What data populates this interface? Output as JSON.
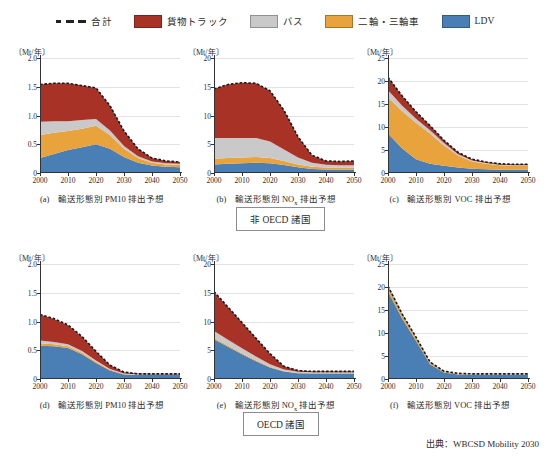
{
  "legend": {
    "items": [
      {
        "name": "total",
        "label": "合計",
        "style": "dashed-line",
        "color": "#222222"
      },
      {
        "name": "freight-truck",
        "label": "貨物トラック",
        "style": "swatch",
        "color": "#a93226"
      },
      {
        "name": "bus",
        "label": "バス",
        "style": "swatch",
        "color": "#c9c9c9"
      },
      {
        "name": "two-three-wheeler",
        "label": "二輪・三輪車",
        "style": "swatch",
        "color": "#e8a council"
      },
      {
        "name": "ldv",
        "label": "LDV",
        "style": "swatch",
        "color": "#4a7fb5"
      }
    ]
  },
  "groups": [
    {
      "name": "non-oecd",
      "label": "非 OECD 諸国"
    },
    {
      "name": "oecd",
      "label": "OECD 諸国"
    }
  ],
  "source": "出典：WBCSD Mobility 2030",
  "axis_unit": "〔Mt/年〕",
  "chart_data": [
    {
      "id": "a",
      "type": "area",
      "stacked": true,
      "caption_prefix": "(a)",
      "caption": "輸送形態別 PM10 排出予想",
      "caption_sub": "",
      "region": "非 OECD 諸国",
      "title": "輸送形態別 PM10 排出予想",
      "xlabel": "",
      "ylabel": "〔Mt/年〕",
      "ylim": [
        0,
        2.0
      ],
      "yticks": [
        0,
        0.5,
        1.0,
        1.5,
        2.0
      ],
      "ytick_labels": [
        "0",
        "0.5",
        "1.0",
        "1.5",
        "2.0"
      ],
      "xlim": [
        2000,
        2050
      ],
      "xticks": [
        2000,
        2010,
        2020,
        2030,
        2040,
        2050
      ],
      "xtick_labels": [
        "2000",
        "2010",
        "2020",
        "2030",
        "2040",
        "2050"
      ],
      "x": [
        2000,
        2005,
        2010,
        2015,
        2020,
        2025,
        2030,
        2035,
        2040,
        2045,
        2050
      ],
      "series": [
        {
          "name": "LDV",
          "color": "#4a7fb5",
          "values": [
            0.26,
            0.33,
            0.4,
            0.45,
            0.5,
            0.42,
            0.28,
            0.18,
            0.13,
            0.11,
            0.1
          ]
        },
        {
          "name": "二輪・三輪車",
          "color": "#e8a33d",
          "values": [
            0.4,
            0.37,
            0.33,
            0.32,
            0.32,
            0.24,
            0.14,
            0.08,
            0.05,
            0.04,
            0.04
          ]
        },
        {
          "name": "バス",
          "color": "#c9c9c9",
          "values": [
            0.23,
            0.2,
            0.17,
            0.15,
            0.12,
            0.08,
            0.05,
            0.03,
            0.02,
            0.02,
            0.02
          ]
        },
        {
          "name": "貨物トラック",
          "color": "#a93226",
          "values": [
            0.65,
            0.66,
            0.66,
            0.6,
            0.54,
            0.43,
            0.26,
            0.13,
            0.06,
            0.04,
            0.03
          ]
        }
      ],
      "total": [
        1.54,
        1.56,
        1.56,
        1.52,
        1.48,
        1.17,
        0.73,
        0.42,
        0.26,
        0.21,
        0.19
      ]
    },
    {
      "id": "b",
      "type": "area",
      "stacked": true,
      "caption_prefix": "(b)",
      "caption": "輸送形態別 NOx 排出予想",
      "caption_sub": "x",
      "region": "非 OECD 諸国",
      "title": "輸送形態別 NOx 排出予想",
      "xlabel": "",
      "ylabel": "〔Mt/年〕",
      "ylim": [
        0,
        20
      ],
      "yticks": [
        0,
        5,
        10,
        15,
        20
      ],
      "ytick_labels": [
        "0",
        "5",
        "10",
        "15",
        "20"
      ],
      "xlim": [
        2000,
        2050
      ],
      "xticks": [
        2000,
        2010,
        2020,
        2030,
        2040,
        2050
      ],
      "xtick_labels": [
        "2000",
        "2010",
        "2020",
        "2030",
        "2040",
        "2050"
      ],
      "x": [
        2000,
        2005,
        2010,
        2015,
        2020,
        2025,
        2030,
        2035,
        2040,
        2045,
        2050
      ],
      "series": [
        {
          "name": "LDV",
          "color": "#4a7fb5",
          "values": [
            1.5,
            1.6,
            1.7,
            1.8,
            1.7,
            1.4,
            1.0,
            0.7,
            0.6,
            0.55,
            0.55
          ]
        },
        {
          "name": "二輪・三輪車",
          "color": "#e8a33d",
          "values": [
            1.0,
            1.0,
            1.0,
            1.0,
            0.9,
            0.7,
            0.5,
            0.4,
            0.35,
            0.35,
            0.35
          ]
        },
        {
          "name": "バス",
          "color": "#c9c9c9",
          "values": [
            3.6,
            3.5,
            3.4,
            3.3,
            2.9,
            2.0,
            1.2,
            0.7,
            0.5,
            0.45,
            0.45
          ]
        },
        {
          "name": "貨物トラック",
          "color": "#a93226",
          "values": [
            8.5,
            9.3,
            9.6,
            9.5,
            8.8,
            6.8,
            3.6,
            1.3,
            0.65,
            0.65,
            0.75
          ]
        }
      ],
      "total": [
        14.6,
        15.4,
        15.7,
        15.6,
        14.3,
        10.9,
        6.3,
        3.1,
        2.1,
        2.0,
        2.1
      ]
    },
    {
      "id": "c",
      "type": "area",
      "stacked": true,
      "caption_prefix": "(c)",
      "caption": "輸送形態別 VOC 排出予想",
      "caption_sub": "",
      "region": "非 OECD 諸国",
      "title": "輸送形態別 VOC 排出予想",
      "xlabel": "",
      "ylabel": "〔Mt/年〕",
      "ylim": [
        0,
        25
      ],
      "yticks": [
        0,
        5,
        10,
        15,
        20,
        25
      ],
      "ytick_labels": [
        "0",
        "5",
        "10",
        "15",
        "20",
        "25"
      ],
      "xlim": [
        2000,
        2050
      ],
      "xticks": [
        2000,
        2010,
        2020,
        2030,
        2040,
        2050
      ],
      "xtick_labels": [
        "2000",
        "2010",
        "2020",
        "2030",
        "2040",
        "2050"
      ],
      "x": [
        2000,
        2005,
        2010,
        2015,
        2020,
        2025,
        2030,
        2035,
        2040,
        2045,
        2050
      ],
      "series": [
        {
          "name": "LDV",
          "color": "#4a7fb5",
          "values": [
            8.6,
            5.4,
            3.0,
            2.0,
            1.6,
            1.2,
            0.9,
            0.8,
            0.7,
            0.7,
            0.7
          ]
        },
        {
          "name": "二輪・三輪車",
          "color": "#e8a33d",
          "values": [
            7.8,
            8.1,
            7.9,
            6.6,
            4.4,
            2.6,
            1.6,
            1.2,
            1.0,
            0.9,
            0.9
          ]
        },
        {
          "name": "バス",
          "color": "#c9c9c9",
          "values": [
            1.6,
            1.2,
            0.9,
            0.7,
            0.5,
            0.3,
            0.2,
            0.15,
            0.1,
            0.1,
            0.1
          ]
        },
        {
          "name": "貨物トラック",
          "color": "#a93226",
          "values": [
            2.8,
            2.1,
            1.5,
            1.0,
            0.6,
            0.4,
            0.3,
            0.25,
            0.2,
            0.2,
            0.2
          ]
        }
      ],
      "total": [
        20.8,
        16.8,
        13.3,
        10.3,
        7.1,
        4.5,
        3.0,
        2.4,
        2.0,
        1.9,
        1.9
      ]
    },
    {
      "id": "d",
      "type": "area",
      "stacked": true,
      "caption_prefix": "(d)",
      "caption": "輸送形態別 PM10 排出予想",
      "caption_sub": "",
      "region": "OECD 諸国",
      "title": "輸送形態別 PM10 排出予想",
      "xlabel": "",
      "ylabel": "〔Mt/年〕",
      "ylim": [
        0,
        2.0
      ],
      "yticks": [
        0,
        0.5,
        1.0,
        1.5,
        2.0
      ],
      "ytick_labels": [
        "0",
        "0.5",
        "1.0",
        "1.5",
        "2.0"
      ],
      "xlim": [
        2000,
        2050
      ],
      "xticks": [
        2000,
        2010,
        2020,
        2030,
        2040,
        2050
      ],
      "xtick_labels": [
        "2000",
        "2010",
        "2020",
        "2030",
        "2040",
        "2050"
      ],
      "x": [
        2000,
        2005,
        2010,
        2015,
        2020,
        2025,
        2030,
        2035,
        2040,
        2045,
        2050
      ],
      "series": [
        {
          "name": "LDV",
          "color": "#4a7fb5",
          "values": [
            0.58,
            0.57,
            0.54,
            0.43,
            0.28,
            0.15,
            0.08,
            0.07,
            0.07,
            0.07,
            0.07
          ]
        },
        {
          "name": "二輪・三輪車",
          "color": "#e8a33d",
          "values": [
            0.04,
            0.035,
            0.03,
            0.025,
            0.02,
            0.01,
            0.008,
            0.006,
            0.005,
            0.005,
            0.005
          ]
        },
        {
          "name": "バス",
          "color": "#c9c9c9",
          "values": [
            0.05,
            0.04,
            0.035,
            0.03,
            0.02,
            0.012,
            0.008,
            0.006,
            0.005,
            0.005,
            0.005
          ]
        },
        {
          "name": "貨物トラック",
          "color": "#a93226",
          "values": [
            0.45,
            0.4,
            0.33,
            0.25,
            0.16,
            0.07,
            0.02,
            0.012,
            0.01,
            0.01,
            0.01
          ]
        }
      ],
      "total": [
        1.12,
        1.05,
        0.94,
        0.74,
        0.48,
        0.24,
        0.12,
        0.09,
        0.09,
        0.09,
        0.09
      ]
    },
    {
      "id": "e",
      "type": "area",
      "stacked": true,
      "caption_prefix": "(e)",
      "caption": "輸送形態別 NOx 排出予想",
      "caption_sub": "x",
      "region": "OECD 諸国",
      "title": "輸送形態別 NOx 排出予想",
      "xlabel": "",
      "ylabel": "〔Mt/年〕",
      "ylim": [
        0,
        20
      ],
      "yticks": [
        0,
        5,
        10,
        15,
        20
      ],
      "ytick_labels": [
        "0",
        "5",
        "10",
        "15",
        "20"
      ],
      "xlim": [
        2000,
        2050
      ],
      "xticks": [
        2000,
        2010,
        2020,
        2030,
        2040,
        2050
      ],
      "xtick_labels": [
        "2000",
        "2010",
        "2020",
        "2030",
        "2040",
        "2050"
      ],
      "x": [
        2000,
        2005,
        2010,
        2015,
        2020,
        2025,
        2030,
        2035,
        2040,
        2045,
        2050
      ],
      "series": [
        {
          "name": "LDV",
          "color": "#4a7fb5",
          "values": [
            6.9,
            5.6,
            4.3,
            3.1,
            2.0,
            1.3,
            1.0,
            0.95,
            0.95,
            0.95,
            0.95
          ]
        },
        {
          "name": "二輪・三輪車",
          "color": "#e8a33d",
          "values": [
            0.25,
            0.22,
            0.18,
            0.15,
            0.12,
            0.08,
            0.06,
            0.05,
            0.05,
            0.05,
            0.05
          ]
        },
        {
          "name": "バス",
          "color": "#c9c9c9",
          "values": [
            1.2,
            1.0,
            0.85,
            0.65,
            0.45,
            0.28,
            0.2,
            0.18,
            0.18,
            0.18,
            0.18
          ]
        },
        {
          "name": "貨物トラック",
          "color": "#a93226",
          "values": [
            6.8,
            5.7,
            4.5,
            3.2,
            1.8,
            0.55,
            0.2,
            0.15,
            0.15,
            0.15,
            0.15
          ]
        }
      ],
      "total": [
        15.2,
        12.5,
        9.8,
        7.1,
        4.4,
        2.2,
        1.45,
        1.33,
        1.33,
        1.33,
        1.33
      ]
    },
    {
      "id": "f",
      "type": "area",
      "stacked": true,
      "caption_prefix": "(f)",
      "caption": "輸送形態別 VOC 排出予想",
      "caption_sub": "",
      "region": "OECD 諸国",
      "title": "輸送形態別 VOC 排出予想",
      "xlabel": "",
      "ylabel": "〔Mt/年〕",
      "ylim": [
        0,
        25
      ],
      "yticks": [
        0,
        5,
        10,
        15,
        20,
        25
      ],
      "ytick_labels": [
        "0",
        "5",
        "10",
        "15",
        "20",
        "25"
      ],
      "xlim": [
        2000,
        2050
      ],
      "xticks": [
        2000,
        2010,
        2020,
        2030,
        2040,
        2050
      ],
      "xtick_labels": [
        "2000",
        "2010",
        "2020",
        "2030",
        "2040",
        "2050"
      ],
      "x": [
        2000,
        2005,
        2010,
        2015,
        2020,
        2025,
        2030,
        2035,
        2040,
        2045,
        2050
      ],
      "series": [
        {
          "name": "LDV",
          "color": "#4a7fb5",
          "values": [
            19.0,
            13.2,
            8.3,
            3.2,
            1.4,
            1.0,
            0.9,
            0.9,
            0.9,
            0.9,
            0.9
          ]
        },
        {
          "name": "二輪・三輪車",
          "color": "#e8a33d",
          "values": [
            0.9,
            0.75,
            0.6,
            0.35,
            0.2,
            0.15,
            0.15,
            0.15,
            0.15,
            0.15,
            0.15
          ]
        },
        {
          "name": "バス",
          "color": "#c9c9c9",
          "values": [
            0.1,
            0.08,
            0.07,
            0.05,
            0.04,
            0.03,
            0.03,
            0.03,
            0.03,
            0.03,
            0.03
          ]
        },
        {
          "name": "貨物トラック",
          "color": "#a93226",
          "values": [
            0.2,
            0.15,
            0.12,
            0.08,
            0.05,
            0.04,
            0.04,
            0.04,
            0.04,
            0.04,
            0.04
          ]
        }
      ],
      "total": [
        20.2,
        14.2,
        9.1,
        3.7,
        1.7,
        1.22,
        1.12,
        1.12,
        1.12,
        1.12,
        1.12
      ]
    }
  ]
}
